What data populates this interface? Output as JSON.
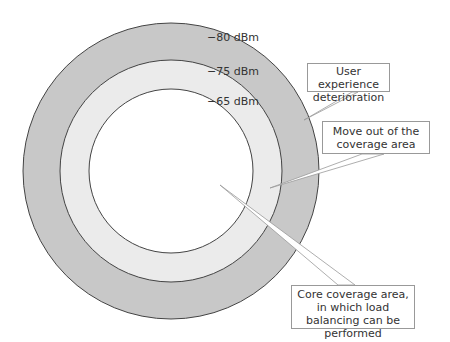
{
  "diagram": {
    "rings": [
      {
        "label": "−80 dBm",
        "color": "#c8c8c8"
      },
      {
        "label": "−75 dBm",
        "color": "#ebebeb"
      },
      {
        "label": "−65 dBm",
        "color": "#ffffff"
      }
    ],
    "callouts": {
      "deterioration": "User experience deterioration",
      "move_out": "Move out of the coverage area",
      "core": "Core coverage area, in which load balancing can be performed"
    }
  }
}
